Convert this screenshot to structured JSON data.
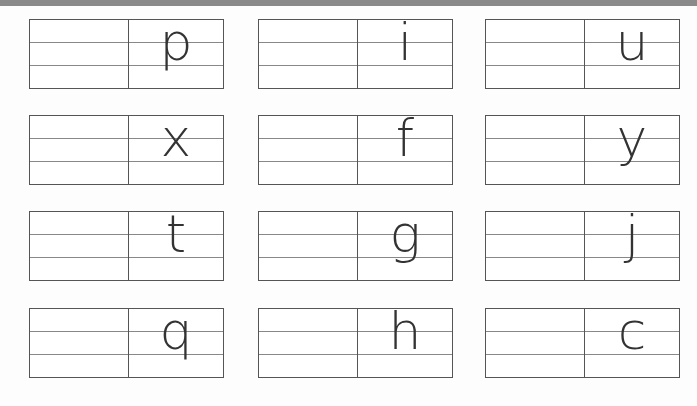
{
  "worksheet": {
    "type": "letter tracing practice",
    "cards": [
      {
        "letter": "p",
        "row": 0,
        "col": 0
      },
      {
        "letter": "i",
        "row": 0,
        "col": 1
      },
      {
        "letter": "u",
        "row": 0,
        "col": 2
      },
      {
        "letter": "x",
        "row": 1,
        "col": 0
      },
      {
        "letter": "f",
        "row": 1,
        "col": 1
      },
      {
        "letter": "y",
        "row": 1,
        "col": 2
      },
      {
        "letter": "t",
        "row": 2,
        "col": 0
      },
      {
        "letter": "g",
        "row": 2,
        "col": 1
      },
      {
        "letter": "j",
        "row": 2,
        "col": 2
      },
      {
        "letter": "q",
        "row": 3,
        "col": 0
      },
      {
        "letter": "h",
        "row": 3,
        "col": 1
      },
      {
        "letter": "c",
        "row": 3,
        "col": 2
      }
    ]
  },
  "colors": {
    "border": "#555555",
    "guide_line": "#888888",
    "letter": "#333333",
    "top_bar": "#8a8a8a"
  }
}
